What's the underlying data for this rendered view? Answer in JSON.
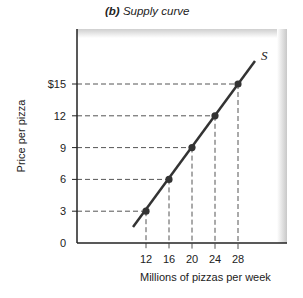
{
  "chart_data": {
    "type": "line",
    "title_prefix": "(b)",
    "title": "Supply curve",
    "xlabel": "Millions of pizzas per week",
    "ylabel": "Price per pizza",
    "series": [
      {
        "name": "S",
        "x": [
          12,
          16,
          20,
          24,
          28
        ],
        "y": [
          3,
          6,
          9,
          12,
          15
        ]
      }
    ],
    "x_ticks": [
      "12",
      "16",
      "20",
      "24",
      "28"
    ],
    "y_ticks": [
      "0",
      "3",
      "6",
      "9",
      "12",
      "$15"
    ],
    "y_tick_values": [
      0,
      3,
      6,
      9,
      12,
      15
    ],
    "x_tick_values": [
      12,
      16,
      20,
      24,
      28
    ],
    "curve_label": "S",
    "grid": false,
    "dashed_guides": true,
    "colors": {
      "line": "#333333",
      "points": "#333333",
      "guides": "#555555"
    }
  }
}
